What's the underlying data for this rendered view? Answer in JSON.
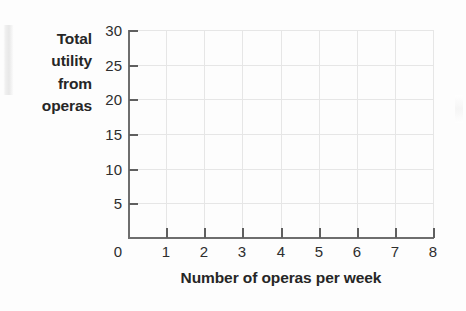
{
  "chart_data": {
    "type": "line",
    "title": "",
    "subtitle": "",
    "xlabel": "Number of operas per week",
    "ylabel": "Total utility from operas",
    "ylabel_lines": [
      "Total",
      "utility",
      "from",
      "operas"
    ],
    "xlim": [
      0,
      8
    ],
    "ylim": [
      0,
      30
    ],
    "x_ticks": [
      0,
      1,
      2,
      3,
      4,
      5,
      6,
      7,
      8
    ],
    "x_tick_labels": [
      "0",
      "1",
      "2",
      "3",
      "4",
      "5",
      "6",
      "7",
      "8"
    ],
    "y_ticks": [
      5,
      10,
      15,
      20,
      25,
      30
    ],
    "y_tick_labels": [
      "5",
      "10",
      "15",
      "20",
      "25",
      "30"
    ],
    "y_origin_label": "0",
    "grid": true,
    "grid_axes": "both",
    "legend": null,
    "series": [],
    "values": [],
    "annotations": [],
    "note": "Blank plotting grid — no data plotted"
  },
  "colors": {
    "background": "#fdfdfd",
    "text": "#262626",
    "tick_text": "#2e2e2e",
    "axis": "#6e6e6e",
    "tick": "#5f5f5f",
    "gridline": "#e6e6e6"
  }
}
